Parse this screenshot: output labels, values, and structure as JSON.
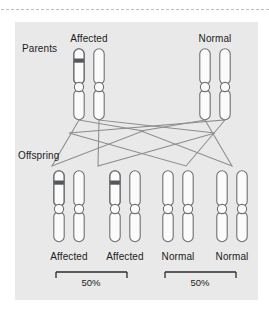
{
  "figure": {
    "background_color": "#e9e9e9",
    "page_color": "#ffffff",
    "outline_color": "#6e7073",
    "band_color": "#54585c",
    "chromosome_fill": "#fbfbfb",
    "line_color": "#8a8d90",
    "text_color": "#1b1b1b"
  },
  "rows": {
    "parents": {
      "row_label": "Parents",
      "groups": [
        {
          "label": "Affected",
          "chromosomes": [
            {
              "banded": true
            },
            {
              "banded": false
            }
          ]
        },
        {
          "label": "Normal",
          "chromosomes": [
            {
              "banded": false
            },
            {
              "banded": false
            }
          ]
        }
      ]
    },
    "offspring": {
      "row_label": "Offspring",
      "groups": [
        {
          "label": "Affected",
          "chromosomes": [
            {
              "banded": true
            },
            {
              "banded": false
            }
          ]
        },
        {
          "label": "Affected",
          "chromosomes": [
            {
              "banded": true
            },
            {
              "banded": false
            }
          ]
        },
        {
          "label": "Normal",
          "chromosomes": [
            {
              "banded": false
            },
            {
              "banded": false
            }
          ]
        },
        {
          "label": "Normal",
          "chromosomes": [
            {
              "banded": false
            },
            {
              "banded": false
            }
          ]
        }
      ]
    }
  },
  "brackets": [
    {
      "name": "affected-bracket",
      "percent": "50%"
    },
    {
      "name": "normal-bracket",
      "percent": "50%"
    }
  ]
}
